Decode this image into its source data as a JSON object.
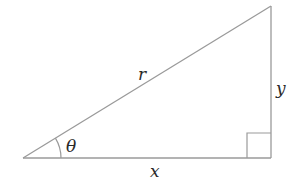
{
  "diagram": {
    "type": "right-triangle",
    "colors": {
      "line": "#9a9a9a",
      "text": "#2a2a2a",
      "background": "#ffffff"
    },
    "vertices": {
      "angle_vertex": [
        23,
        158
      ],
      "right_angle_vertex": [
        271,
        158
      ],
      "top_vertex": [
        271,
        6
      ]
    },
    "labels": {
      "hypotenuse": "r",
      "opposite": "y",
      "adjacent": "x",
      "angle": "θ"
    },
    "right_angle_marker_size": 24
  }
}
